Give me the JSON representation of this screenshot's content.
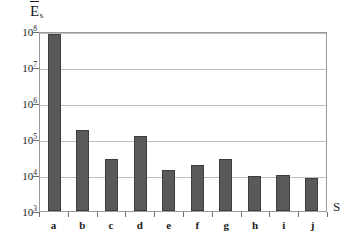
{
  "chart_data": {
    "type": "bar",
    "title": "",
    "subtitle": "",
    "ylabel": "E̅s",
    "ylabel_base": "E",
    "ylabel_sub": "s",
    "xlabel": "S",
    "yscale": "log",
    "ylim": [
      1000,
      100000000
    ],
    "grid": true,
    "legend": "none",
    "categories": [
      "a",
      "b",
      "c",
      "d",
      "e",
      "f",
      "g",
      "h",
      "i",
      "j"
    ],
    "values": [
      85000000,
      175000,
      28000,
      120000,
      13500,
      18500,
      28000,
      9300,
      10200,
      8200
    ],
    "ytick_labels": [
      "10^8",
      "10^7",
      "10^6",
      "10^5",
      "10^4",
      "10^3"
    ],
    "yticks": [
      {
        "mantissa": "10",
        "exponent": "8",
        "value": 100000000
      },
      {
        "mantissa": "10",
        "exponent": "7",
        "value": 10000000
      },
      {
        "mantissa": "10",
        "exponent": "6",
        "value": 1000000
      },
      {
        "mantissa": "10",
        "exponent": "5",
        "value": 100000
      },
      {
        "mantissa": "10",
        "exponent": "4",
        "value": 10000
      },
      {
        "mantissa": "10",
        "exponent": "3",
        "value": 1000
      }
    ],
    "colors": {
      "bar_fill": "#595959",
      "bar_edge": "#3d3d3d",
      "gridline": "#bdbdbd",
      "frame": "#9a9a9a",
      "background": "#ffffff",
      "text": "#1a1a1a"
    }
  }
}
